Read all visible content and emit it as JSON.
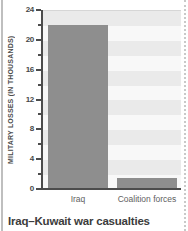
{
  "page": {
    "title": "Iraq–Kuwait war casualties"
  },
  "chart_data": {
    "type": "bar",
    "categories": [
      "Iraq",
      "Coalition forces"
    ],
    "values": [
      22,
      1.5
    ],
    "title": "Iraq–Kuwait war casualties",
    "xlabel": "",
    "ylabel": "MILITARY LOSSES (IN THOUSANDS)",
    "ylim": [
      0,
      24
    ],
    "ytick_step": 4,
    "minor_tick_step": 2,
    "yticks": [
      0,
      4,
      8,
      12,
      16,
      20,
      24
    ],
    "grid": "striped-horizontal-bands",
    "legend_position": "none",
    "bar_color": "#8e8e8e",
    "band_colors": [
      "#eaeaea",
      "#f8f8f8"
    ],
    "axis_color": "#4c4c4c"
  }
}
